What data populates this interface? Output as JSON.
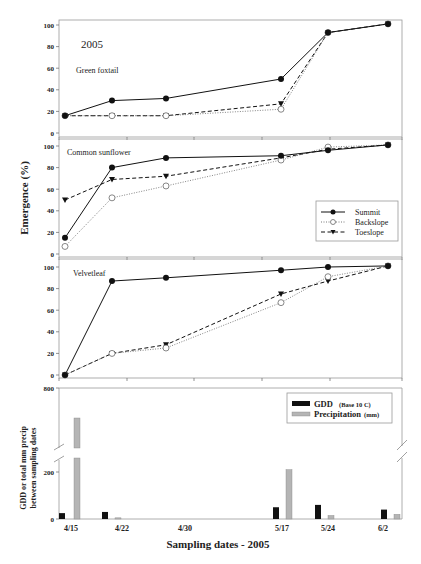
{
  "chart_data": [
    {
      "type": "line",
      "title": "Green foxtail",
      "annotation": "2005",
      "ylabel": "Emergence (%)",
      "ylim": [
        0,
        100
      ],
      "yticks": [
        0,
        20,
        40,
        60,
        80,
        100
      ],
      "x": [
        "4/15",
        "4/22",
        "4/30",
        "5/17",
        "5/24",
        "6/2"
      ],
      "series": [
        {
          "name": "Summit",
          "values": [
            16,
            30,
            32,
            50,
            93,
            101
          ]
        },
        {
          "name": "Backslope",
          "values": [
            16,
            16,
            16,
            22,
            93,
            101
          ]
        },
        {
          "name": "Toeslope",
          "values": [
            16,
            16,
            16,
            27,
            93,
            101
          ]
        }
      ]
    },
    {
      "type": "line",
      "title": "Common sunflower",
      "ylabel": "Emergence (%)",
      "ylim": [
        0,
        100
      ],
      "yticks": [
        0,
        20,
        40,
        60,
        80,
        100
      ],
      "x": [
        "4/15",
        "4/22",
        "4/30",
        "5/17",
        "5/24",
        "6/2"
      ],
      "legend": [
        "Summit",
        "Backslope",
        "Toeslope"
      ],
      "legend_position": "lower right",
      "series": [
        {
          "name": "Summit",
          "values": [
            15,
            80,
            89,
            91,
            96,
            101
          ]
        },
        {
          "name": "Backslope",
          "values": [
            7,
            52,
            63,
            87,
            99,
            101
          ]
        },
        {
          "name": "Toeslope",
          "values": [
            50,
            69,
            72,
            89,
            97,
            101
          ]
        }
      ]
    },
    {
      "type": "line",
      "title": "Velvetleaf",
      "ylabel": "Emergence (%)",
      "ylim": [
        0,
        100
      ],
      "yticks": [
        0,
        20,
        40,
        60,
        80,
        100
      ],
      "x": [
        "4/15",
        "4/22",
        "4/30",
        "5/17",
        "5/24",
        "6/2"
      ],
      "series": [
        {
          "name": "Summit",
          "values": [
            0,
            87,
            90,
            97,
            100,
            101
          ]
        },
        {
          "name": "Backslope",
          "values": [
            0,
            20,
            25,
            67,
            91,
            101
          ]
        },
        {
          "name": "Toeslope",
          "values": [
            0,
            20,
            28,
            75,
            87,
            101
          ]
        }
      ]
    },
    {
      "type": "bar",
      "xlabel": "Sampling dates - 2005",
      "ylabel": "GDD or total mm precip between sampling dates",
      "yticks": [
        0,
        200,
        800
      ],
      "axis_break": true,
      "categories": [
        "4/15",
        "4/22",
        "4/30",
        "5/17",
        "5/24",
        "6/2"
      ],
      "legend": [
        "GDD (Base 10 C)",
        "Precipitation (mm)"
      ],
      "legend_position": "upper right",
      "series": [
        {
          "name": "GDD (Base 10 C)",
          "values": [
            25,
            30,
            0,
            50,
            60,
            40
          ]
        },
        {
          "name": "Precipitation (mm)",
          "values": [
            700,
            5,
            0,
            210,
            15,
            20
          ]
        }
      ]
    }
  ],
  "labels": {
    "year": "2005",
    "panel1": "Green foxtail",
    "panel2": "Common sunflower",
    "panel3": "Velvetleaf",
    "ylabel_emergence": "Emergence (%)",
    "ylabel_bar_line1": "GDD or total mm precip",
    "ylabel_bar_line2": "between sampling dates",
    "xlabel": "Sampling dates - 2005",
    "legend_line": [
      "Summit",
      "Backslope",
      "Toeslope"
    ],
    "legend_bar_gdd": "GDD",
    "legend_bar_gdd_small": "(Base 10 C)",
    "legend_bar_precip": "Precipitation",
    "legend_bar_precip_small": "(mm)",
    "dates": [
      "4/15",
      "4/22",
      "4/30",
      "5/17",
      "5/24",
      "6/2"
    ],
    "yticks_pct": [
      "0",
      "20",
      "40",
      "60",
      "80",
      "100"
    ],
    "yticks_bar": [
      "0",
      "200",
      "800"
    ]
  },
  "colors": {
    "gdd": "#111111",
    "precip": "#b5b5b5",
    "line": "#111111",
    "frame": "#999999"
  }
}
